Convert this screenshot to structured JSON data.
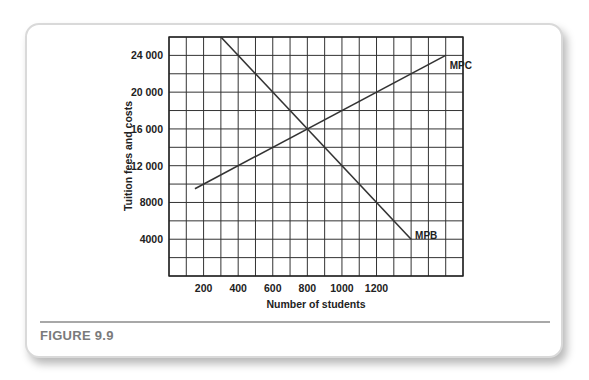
{
  "figure": {
    "caption": "FIGURE 9.9"
  },
  "chart_data": {
    "type": "line",
    "title": "",
    "xlabel": "Number of students",
    "ylabel": "Tuition fees and costs",
    "xlim": [
      0,
      1700
    ],
    "ylim": [
      0,
      26000
    ],
    "grid": true,
    "x_grid_step": 100,
    "y_grid_step": 2000,
    "x_ticks": [
      200,
      400,
      600,
      800,
      1000,
      1200
    ],
    "x_tick_labels": [
      "200",
      "400",
      "600",
      "800",
      "1000",
      "1200"
    ],
    "y_ticks": [
      4000,
      8000,
      12000,
      16000,
      20000,
      24000
    ],
    "y_tick_labels": [
      "4000",
      "8000",
      "12 000",
      "16 000",
      "20 000",
      "24 000"
    ],
    "series": [
      {
        "name": "MPC",
        "x": [
          150,
          1600
        ],
        "y": [
          9500,
          24000
        ],
        "label_at": [
          1600,
          23000
        ]
      },
      {
        "name": "MPB",
        "x": [
          300,
          1400
        ],
        "y": [
          26000,
          4000
        ],
        "label_at": [
          1400,
          4500
        ]
      }
    ],
    "legend": "none (inline labels)",
    "annotations": [
      {
        "text": "Intersection",
        "x": 800,
        "y": 16000,
        "visible": false
      }
    ]
  }
}
